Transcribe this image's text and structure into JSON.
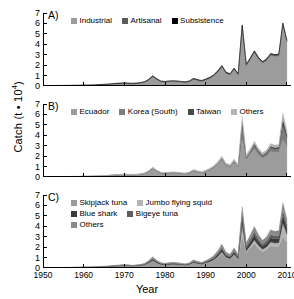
{
  "axes": {
    "ylabel_text": "Catch (t • 10",
    "ylabel_exp": "4",
    "ylabel_close": ")",
    "xlabel": "Year",
    "yticks": [
      "7",
      "6",
      "5",
      "4",
      "3",
      "2",
      "1",
      "0"
    ],
    "xticks": [
      "1950",
      "1960",
      "1970",
      "1980",
      "1990",
      "2000",
      "2010"
    ],
    "ylim": [
      0,
      7
    ],
    "xlim": [
      1950,
      2011
    ]
  },
  "colors": {
    "light_gray": "#9c9c9c",
    "mid_gray": "#707070",
    "dark_gray": "#4a4a4a",
    "black": "#000000",
    "pale_gray": "#b5b5b5",
    "axis": "#000000"
  },
  "panels": {
    "a": {
      "letter": "A)",
      "legend": [
        [
          {
            "label": "Industrial",
            "color": "#9c9c9c"
          },
          {
            "label": "Artisanal",
            "color": "#5a5a5a"
          },
          {
            "label": "Subsistence",
            "color": "#000000"
          }
        ]
      ]
    },
    "b": {
      "letter": "B)",
      "legend": [
        [
          {
            "label": "Ecuador",
            "color": "#9c9c9c"
          },
          {
            "label": "Korea (South)",
            "color": "#7d7d7d"
          },
          {
            "label": "Taiwan",
            "color": "#4a4a4a"
          },
          {
            "label": "Others",
            "color": "#b5b5b5"
          }
        ]
      ]
    },
    "c": {
      "letter": "C)",
      "legend": [
        [
          {
            "label": "Skipjack tuna",
            "color": "#9c9c9c"
          },
          {
            "label": "Jumbo flying squid",
            "color": "#b5b5b5"
          }
        ],
        [
          {
            "label": "Blue shark",
            "color": "#3a3a3a"
          },
          {
            "label": "Bigeye tuna",
            "color": "#5e5e5e"
          }
        ],
        [
          {
            "label": "Others",
            "color": "#8a8a8a"
          }
        ]
      ]
    }
  },
  "chart_data": {
    "type": "area",
    "title": "",
    "xlabel": "Year",
    "ylabel": "Catch (t • 10^4)",
    "xlim": [
      1950,
      2011
    ],
    "ylim": [
      0,
      7
    ],
    "grid": false,
    "legend_position": "inside-top-left",
    "x": [
      1950,
      1951,
      1952,
      1953,
      1954,
      1955,
      1956,
      1957,
      1958,
      1959,
      1960,
      1961,
      1962,
      1963,
      1964,
      1965,
      1966,
      1967,
      1968,
      1969,
      1970,
      1971,
      1972,
      1973,
      1974,
      1975,
      1976,
      1977,
      1978,
      1979,
      1980,
      1981,
      1982,
      1983,
      1984,
      1985,
      1986,
      1987,
      1988,
      1989,
      1990,
      1991,
      1992,
      1993,
      1994,
      1995,
      1996,
      1997,
      1998,
      1999,
      2000,
      2001,
      2002,
      2003,
      2004,
      2005,
      2006,
      2007,
      2008,
      2009,
      2010
    ],
    "panels": [
      {
        "id": "A",
        "letter": "A)",
        "stack_order": [
          "Industrial",
          "Artisanal",
          "Subsistence"
        ],
        "series": [
          {
            "name": "Industrial",
            "color": "#9c9c9c",
            "values": [
              0.02,
              0.02,
              0.02,
              0.03,
              0.03,
              0.03,
              0.04,
              0.04,
              0.05,
              0.05,
              0.06,
              0.06,
              0.07,
              0.08,
              0.1,
              0.12,
              0.14,
              0.17,
              0.2,
              0.22,
              0.24,
              0.22,
              0.2,
              0.22,
              0.26,
              0.34,
              0.55,
              0.88,
              0.6,
              0.4,
              0.36,
              0.4,
              0.42,
              0.4,
              0.36,
              0.32,
              0.4,
              0.62,
              0.52,
              0.44,
              0.56,
              0.72,
              0.95,
              1.3,
              1.8,
              1.2,
              1.05,
              1.55,
              1.05,
              5.7,
              1.95,
              2.55,
              3.2,
              2.6,
              2.2,
              2.45,
              2.95,
              2.85,
              2.9,
              5.85,
              4.2
            ]
          },
          {
            "name": "Artisanal",
            "color": "#5a5a5a",
            "values": [
              0.015,
              0.015,
              0.015,
              0.02,
              0.02,
              0.02,
              0.02,
              0.02,
              0.02,
              0.02,
              0.03,
              0.03,
              0.03,
              0.03,
              0.04,
              0.04,
              0.04,
              0.05,
              0.05,
              0.05,
              0.06,
              0.06,
              0.06,
              0.06,
              0.07,
              0.07,
              0.08,
              0.09,
              0.08,
              0.07,
              0.07,
              0.08,
              0.08,
              0.08,
              0.07,
              0.07,
              0.08,
              0.1,
              0.09,
              0.08,
              0.09,
              0.1,
              0.12,
              0.14,
              0.16,
              0.13,
              0.12,
              0.15,
              0.12,
              0.14,
              0.13,
              0.14,
              0.16,
              0.14,
              0.13,
              0.14,
              0.16,
              0.15,
              0.15,
              0.18,
              0.16
            ]
          },
          {
            "name": "Subsistence",
            "color": "#000000",
            "values": [
              0.005,
              0.005,
              0.005,
              0.005,
              0.005,
              0.005,
              0.005,
              0.005,
              0.005,
              0.005,
              0.005,
              0.005,
              0.005,
              0.005,
              0.006,
              0.006,
              0.006,
              0.007,
              0.007,
              0.007,
              0.008,
              0.008,
              0.008,
              0.008,
              0.008,
              0.009,
              0.009,
              0.01,
              0.01,
              0.01,
              0.01,
              0.01,
              0.01,
              0.01,
              0.01,
              0.01,
              0.01,
              0.012,
              0.012,
              0.012,
              0.012,
              0.013,
              0.014,
              0.015,
              0.016,
              0.015,
              0.014,
              0.016,
              0.014,
              0.016,
              0.015,
              0.016,
              0.017,
              0.016,
              0.015,
              0.016,
              0.017,
              0.017,
              0.017,
              0.018,
              0.017
            ]
          }
        ]
      },
      {
        "id": "B",
        "letter": "B)",
        "stack_order": [
          "Ecuador",
          "Korea (South)",
          "Taiwan",
          "Others"
        ],
        "series": [
          {
            "name": "Ecuador",
            "color": "#9c9c9c",
            "values": [
              0.02,
              0.02,
              0.02,
              0.03,
              0.03,
              0.03,
              0.04,
              0.04,
              0.05,
              0.05,
              0.06,
              0.06,
              0.07,
              0.08,
              0.1,
              0.12,
              0.14,
              0.17,
              0.2,
              0.22,
              0.24,
              0.22,
              0.2,
              0.22,
              0.26,
              0.34,
              0.55,
              0.8,
              0.55,
              0.38,
              0.34,
              0.38,
              0.4,
              0.38,
              0.34,
              0.3,
              0.38,
              0.58,
              0.48,
              0.4,
              0.52,
              0.66,
              0.88,
              1.2,
              1.65,
              1.1,
              0.95,
              1.4,
              0.95,
              3.7,
              1.7,
              2.2,
              2.7,
              2.15,
              1.8,
              2.0,
              2.45,
              2.35,
              2.4,
              3.6,
              2.9
            ]
          },
          {
            "name": "Korea (South)",
            "color": "#7d7d7d",
            "values": [
              0.0,
              0.0,
              0.0,
              0.0,
              0.0,
              0.0,
              0.0,
              0.0,
              0.0,
              0.0,
              0.0,
              0.0,
              0.0,
              0.0,
              0.0,
              0.0,
              0.0,
              0.0,
              0.0,
              0.0,
              0.0,
              0.0,
              0.0,
              0.0,
              0.0,
              0.0,
              0.0,
              0.01,
              0.01,
              0.01,
              0.01,
              0.01,
              0.01,
              0.01,
              0.01,
              0.01,
              0.01,
              0.02,
              0.02,
              0.02,
              0.02,
              0.03,
              0.04,
              0.06,
              0.08,
              0.05,
              0.05,
              0.07,
              0.05,
              1.1,
              0.12,
              0.2,
              0.3,
              0.25,
              0.2,
              0.25,
              0.32,
              0.3,
              0.3,
              1.3,
              0.85
            ]
          },
          {
            "name": "Taiwan",
            "color": "#4a4a4a",
            "values": [
              0.0,
              0.0,
              0.0,
              0.0,
              0.0,
              0.0,
              0.0,
              0.0,
              0.0,
              0.0,
              0.0,
              0.0,
              0.0,
              0.0,
              0.0,
              0.0,
              0.0,
              0.0,
              0.0,
              0.0,
              0.0,
              0.0,
              0.0,
              0.0,
              0.0,
              0.0,
              0.0,
              0.02,
              0.02,
              0.01,
              0.01,
              0.02,
              0.02,
              0.02,
              0.01,
              0.01,
              0.02,
              0.02,
              0.02,
              0.02,
              0.02,
              0.03,
              0.03,
              0.04,
              0.06,
              0.04,
              0.04,
              0.06,
              0.04,
              0.55,
              0.08,
              0.12,
              0.18,
              0.15,
              0.12,
              0.15,
              0.18,
              0.17,
              0.17,
              0.7,
              0.35
            ]
          },
          {
            "name": "Others",
            "color": "#b5b5b5",
            "values": [
              0.015,
              0.015,
              0.015,
              0.02,
              0.02,
              0.02,
              0.02,
              0.02,
              0.02,
              0.02,
              0.03,
              0.03,
              0.03,
              0.03,
              0.04,
              0.04,
              0.04,
              0.05,
              0.05,
              0.05,
              0.06,
              0.06,
              0.06,
              0.06,
              0.07,
              0.07,
              0.08,
              0.14,
              0.1,
              0.08,
              0.08,
              0.08,
              0.08,
              0.08,
              0.08,
              0.08,
              0.09,
              0.12,
              0.1,
              0.09,
              0.1,
              0.13,
              0.15,
              0.18,
              0.22,
              0.16,
              0.15,
              0.2,
              0.15,
              0.5,
              0.2,
              0.22,
              0.25,
              0.22,
              0.2,
              0.22,
              0.26,
              0.24,
              0.24,
              0.55,
              0.4
            ]
          }
        ]
      },
      {
        "id": "C",
        "letter": "C)",
        "stack_order": [
          "Skipjack tuna",
          "Jumbo flying squid",
          "Blue shark",
          "Bigeye tuna",
          "Others"
        ],
        "series": [
          {
            "name": "Skipjack tuna",
            "color": "#9c9c9c",
            "values": [
              0.02,
              0.02,
              0.02,
              0.03,
              0.03,
              0.03,
              0.04,
              0.04,
              0.05,
              0.05,
              0.06,
              0.06,
              0.07,
              0.08,
              0.09,
              0.11,
              0.13,
              0.15,
              0.18,
              0.2,
              0.22,
              0.2,
              0.18,
              0.2,
              0.23,
              0.3,
              0.48,
              0.7,
              0.48,
              0.33,
              0.3,
              0.33,
              0.35,
              0.33,
              0.3,
              0.26,
              0.33,
              0.5,
              0.42,
              0.35,
              0.45,
              0.58,
              0.76,
              1.05,
              1.45,
              0.96,
              0.83,
              1.22,
              0.83,
              3.1,
              1.48,
              1.92,
              2.35,
              1.88,
              1.57,
              1.74,
              2.13,
              2.05,
              2.09,
              3.05,
              2.45
            ]
          },
          {
            "name": "Jumbo flying squid",
            "color": "#b5b5b5",
            "values": [
              0.0,
              0.0,
              0.0,
              0.0,
              0.0,
              0.0,
              0.0,
              0.0,
              0.0,
              0.0,
              0.0,
              0.0,
              0.0,
              0.0,
              0.0,
              0.0,
              0.0,
              0.0,
              0.0,
              0.0,
              0.0,
              0.0,
              0.0,
              0.0,
              0.0,
              0.0,
              0.0,
              0.01,
              0.01,
              0.01,
              0.01,
              0.01,
              0.01,
              0.01,
              0.01,
              0.01,
              0.01,
              0.02,
              0.02,
              0.02,
              0.02,
              0.03,
              0.04,
              0.06,
              0.09,
              0.06,
              0.05,
              0.08,
              0.05,
              1.05,
              0.14,
              0.22,
              0.34,
              0.28,
              0.22,
              0.28,
              0.36,
              0.34,
              0.34,
              1.25,
              0.8
            ]
          },
          {
            "name": "Blue shark",
            "color": "#3a3a3a",
            "values": [
              0.005,
              0.005,
              0.005,
              0.006,
              0.006,
              0.006,
              0.007,
              0.007,
              0.008,
              0.008,
              0.01,
              0.01,
              0.012,
              0.014,
              0.016,
              0.02,
              0.022,
              0.026,
              0.03,
              0.034,
              0.038,
              0.034,
              0.03,
              0.034,
              0.04,
              0.05,
              0.08,
              0.12,
              0.08,
              0.06,
              0.05,
              0.06,
              0.06,
              0.06,
              0.05,
              0.045,
              0.055,
              0.085,
              0.07,
              0.06,
              0.08,
              0.1,
              0.13,
              0.18,
              0.25,
              0.17,
              0.14,
              0.21,
              0.14,
              0.7,
              0.28,
              0.36,
              0.45,
              0.36,
              0.3,
              0.34,
              0.42,
              0.4,
              0.41,
              0.78,
              0.55
            ]
          },
          {
            "name": "Bigeye tuna",
            "color": "#5e5e5e",
            "values": [
              0.004,
              0.004,
              0.004,
              0.005,
              0.005,
              0.005,
              0.006,
              0.006,
              0.006,
              0.006,
              0.008,
              0.008,
              0.01,
              0.011,
              0.013,
              0.016,
              0.018,
              0.021,
              0.024,
              0.027,
              0.03,
              0.027,
              0.024,
              0.027,
              0.032,
              0.04,
              0.065,
              0.1,
              0.065,
              0.046,
              0.042,
              0.046,
              0.05,
              0.046,
              0.042,
              0.037,
              0.046,
              0.07,
              0.058,
              0.05,
              0.064,
              0.082,
              0.105,
              0.145,
              0.2,
              0.135,
              0.115,
              0.17,
              0.115,
              0.42,
              0.21,
              0.27,
              0.33,
              0.27,
              0.22,
              0.25,
              0.3,
              0.29,
              0.3,
              0.48,
              0.36
            ]
          },
          {
            "name": "Others",
            "color": "#8a8a8a",
            "values": [
              0.006,
              0.006,
              0.006,
              0.008,
              0.008,
              0.008,
              0.009,
              0.009,
              0.01,
              0.01,
              0.012,
              0.012,
              0.014,
              0.016,
              0.02,
              0.024,
              0.027,
              0.032,
              0.036,
              0.04,
              0.046,
              0.04,
              0.036,
              0.04,
              0.048,
              0.06,
              0.1,
              0.15,
              0.1,
              0.07,
              0.064,
              0.07,
              0.074,
              0.07,
              0.064,
              0.056,
              0.07,
              0.105,
              0.088,
              0.075,
              0.096,
              0.124,
              0.16,
              0.22,
              0.3,
              0.2,
              0.175,
              0.26,
              0.175,
              0.63,
              0.32,
              0.41,
              0.5,
              0.41,
              0.34,
              0.38,
              0.46,
              0.44,
              0.45,
              0.72,
              0.54
            ]
          }
        ]
      }
    ]
  }
}
